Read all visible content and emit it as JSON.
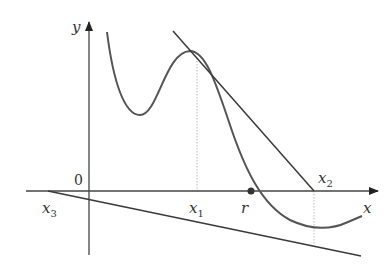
{
  "diagram": {
    "colors": {
      "axis": "#444444",
      "curve": "#555555",
      "tangent": "#3a3a3a",
      "guide": "#bbbbbb",
      "root": "#333333",
      "text": "#333333"
    },
    "axes": {
      "x_label": "x",
      "y_label": "y",
      "origin_label": "0"
    },
    "points": {
      "x1": {
        "label": "x",
        "sub": "1"
      },
      "x2": {
        "label": "x",
        "sub": "2"
      },
      "x3": {
        "label": "x",
        "sub": "3"
      },
      "root": {
        "label": "r"
      }
    }
  }
}
